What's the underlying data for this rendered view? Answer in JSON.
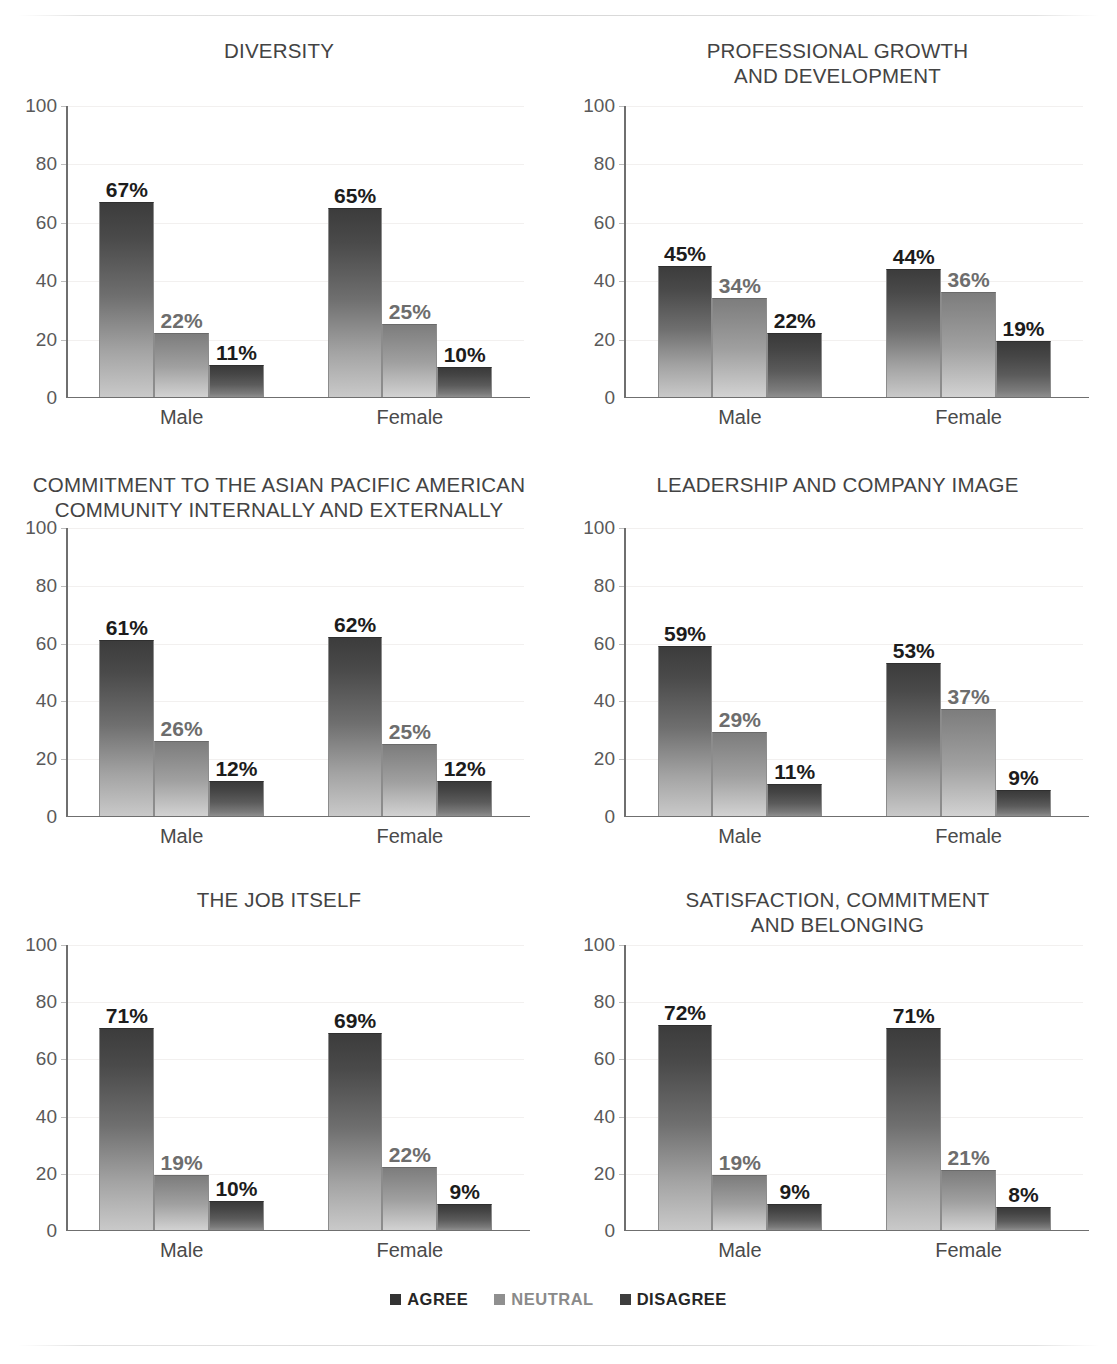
{
  "legend": {
    "items": [
      {
        "label": "AGREE",
        "color": "#333333"
      },
      {
        "label": "NEUTRAL",
        "color": "#8f8f8f"
      },
      {
        "label": "DISAGREE",
        "color": "#3d3d3d"
      }
    ]
  },
  "axis": {
    "ticks": [
      "100",
      "80",
      "60",
      "40",
      "20",
      "0"
    ]
  },
  "chart_data": [
    {
      "type": "bar",
      "title": "DIVERSITY",
      "xlabel": "",
      "ylabel": "",
      "ylim": [
        0,
        100
      ],
      "yticks": [
        0,
        20,
        40,
        60,
        80,
        100
      ],
      "grid": true,
      "legend_position": "bottom",
      "categories": [
        "Male",
        "Female"
      ],
      "series": [
        {
          "name": "AGREE",
          "values": [
            67,
            65
          ],
          "labels": [
            "67%",
            "65%"
          ]
        },
        {
          "name": "NEUTRAL",
          "values": [
            22,
            25
          ],
          "labels": [
            "22%",
            "25%"
          ]
        },
        {
          "name": "DISAGREE",
          "values": [
            11,
            10
          ],
          "labels": [
            "11%",
            "10%"
          ]
        }
      ]
    },
    {
      "type": "bar",
      "title": "PROFESSIONAL GROWTH\nAND DEVELOPMENT",
      "xlabel": "",
      "ylabel": "",
      "ylim": [
        0,
        100
      ],
      "yticks": [
        0,
        20,
        40,
        60,
        80,
        100
      ],
      "grid": true,
      "legend_position": "bottom",
      "categories": [
        "Male",
        "Female"
      ],
      "series": [
        {
          "name": "AGREE",
          "values": [
            45,
            44
          ],
          "labels": [
            "45%",
            "44%"
          ]
        },
        {
          "name": "NEUTRAL",
          "values": [
            34,
            36
          ],
          "labels": [
            "34%",
            "36%"
          ]
        },
        {
          "name": "DISAGREE",
          "values": [
            22,
            19
          ],
          "labels": [
            "22%",
            "19%"
          ]
        }
      ]
    },
    {
      "type": "bar",
      "title": "COMMITMENT TO THE ASIAN PACIFIC AMERICAN\nCOMMUNITY INTERNALLY AND EXTERNALLY",
      "xlabel": "",
      "ylabel": "",
      "ylim": [
        0,
        100
      ],
      "yticks": [
        0,
        20,
        40,
        60,
        80,
        100
      ],
      "grid": true,
      "legend_position": "bottom",
      "categories": [
        "Male",
        "Female"
      ],
      "series": [
        {
          "name": "AGREE",
          "values": [
            61,
            62
          ],
          "labels": [
            "61%",
            "62%"
          ]
        },
        {
          "name": "NEUTRAL",
          "values": [
            26,
            25
          ],
          "labels": [
            "26%",
            "25%"
          ]
        },
        {
          "name": "DISAGREE",
          "values": [
            12,
            12
          ],
          "labels": [
            "12%",
            "12%"
          ]
        }
      ]
    },
    {
      "type": "bar",
      "title": "LEADERSHIP AND COMPANY IMAGE",
      "xlabel": "",
      "ylabel": "",
      "ylim": [
        0,
        100
      ],
      "yticks": [
        0,
        20,
        40,
        60,
        80,
        100
      ],
      "grid": true,
      "legend_position": "bottom",
      "categories": [
        "Male",
        "Female"
      ],
      "series": [
        {
          "name": "AGREE",
          "values": [
            59,
            53
          ],
          "labels": [
            "59%",
            "53%"
          ]
        },
        {
          "name": "NEUTRAL",
          "values": [
            29,
            37
          ],
          "labels": [
            "29%",
            "37%"
          ]
        },
        {
          "name": "DISAGREE",
          "values": [
            11,
            9
          ],
          "labels": [
            "11%",
            "9%"
          ]
        }
      ]
    },
    {
      "type": "bar",
      "title": "THE JOB ITSELF",
      "xlabel": "",
      "ylabel": "",
      "ylim": [
        0,
        100
      ],
      "yticks": [
        0,
        20,
        40,
        60,
        80,
        100
      ],
      "grid": true,
      "legend_position": "bottom",
      "categories": [
        "Male",
        "Female"
      ],
      "series": [
        {
          "name": "AGREE",
          "values": [
            71,
            69
          ],
          "labels": [
            "71%",
            "69%"
          ]
        },
        {
          "name": "NEUTRAL",
          "values": [
            19,
            22
          ],
          "labels": [
            "19%",
            "22%"
          ]
        },
        {
          "name": "DISAGREE",
          "values": [
            10,
            9
          ],
          "labels": [
            "10%",
            "9%"
          ]
        }
      ]
    },
    {
      "type": "bar",
      "title": "SATISFACTION, COMMITMENT\nAND BELONGING",
      "xlabel": "",
      "ylabel": "",
      "ylim": [
        0,
        100
      ],
      "yticks": [
        0,
        20,
        40,
        60,
        80,
        100
      ],
      "grid": true,
      "legend_position": "bottom",
      "categories": [
        "Male",
        "Female"
      ],
      "series": [
        {
          "name": "AGREE",
          "values": [
            72,
            71
          ],
          "labels": [
            "72%",
            "71%"
          ]
        },
        {
          "name": "NEUTRAL",
          "values": [
            19,
            21
          ],
          "labels": [
            "19%",
            "21%"
          ]
        },
        {
          "name": "DISAGREE",
          "values": [
            9,
            8
          ],
          "labels": [
            "9%",
            "8%"
          ]
        }
      ]
    }
  ]
}
